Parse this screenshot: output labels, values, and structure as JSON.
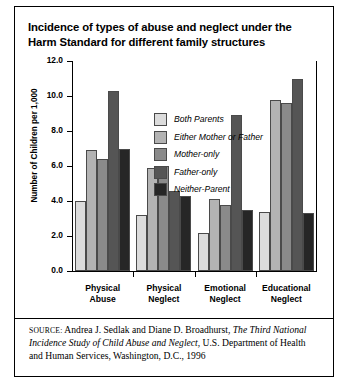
{
  "title": "Incidence of types of abuse and neglect under the Harm Standard for different family structures",
  "source": {
    "kicker": "SOURCE:",
    "text_before": " Andrea J. Sedlak and Diane D. Broadhurst, ",
    "study_title": "The Third National Incidence Study of Child Abuse and Neglect",
    "text_after": ", U.S. Department of Health and Human Services, Washington, D.C., 1996"
  },
  "chart_data": {
    "type": "bar",
    "title": "Incidence of types of abuse and neglect under the Harm Standard for different family structures",
    "xlabel": "",
    "ylabel": "Number of Children per 1,000",
    "ylim": [
      0,
      12
    ],
    "yticks": [
      "0.0",
      "2.0",
      "4.0",
      "6.0",
      "8.0",
      "10.0",
      "12.0"
    ],
    "ytick_values": [
      0,
      2,
      4,
      6,
      8,
      10,
      12
    ],
    "grid": false,
    "legend_position": "upper center",
    "categories": [
      "Physical Abuse",
      "Physical Neglect",
      "Emotional Neglect",
      "Educational Neglect"
    ],
    "category_lines": [
      [
        "Physical",
        "Abuse"
      ],
      [
        "Physical",
        "Neglect"
      ],
      [
        "Emotional",
        "Neglect"
      ],
      [
        "Educational",
        "Neglect"
      ]
    ],
    "series": [
      {
        "name": "Both Parents",
        "color": "#dcdcdc",
        "values": [
          4.0,
          3.2,
          2.2,
          3.4
        ]
      },
      {
        "name": "Either Mother or Father",
        "color": "#b3b3b3",
        "values": [
          6.9,
          5.9,
          4.1,
          9.8
        ]
      },
      {
        "name": "Mother-only",
        "color": "#8a8a8a",
        "values": [
          6.4,
          6.0,
          3.8,
          9.6
        ]
      },
      {
        "name": "Father-only",
        "color": "#555555",
        "values": [
          10.3,
          4.6,
          8.9,
          11.0
        ]
      },
      {
        "name": "Neither-Parent",
        "color": "#262626",
        "values": [
          7.0,
          4.3,
          3.5,
          3.3
        ]
      }
    ]
  }
}
